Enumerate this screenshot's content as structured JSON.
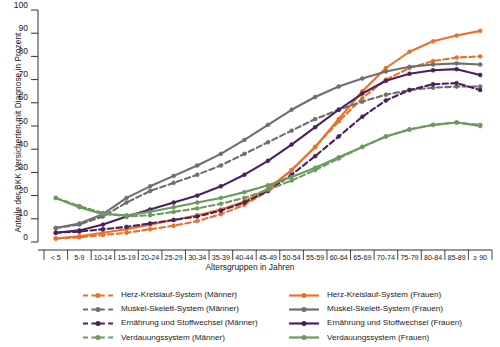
{
  "chart_data": {
    "type": "line",
    "title": "",
    "xlabel": "Altersgruppen in Jahren",
    "ylabel": "Anteile der BKK Versicherten mit Diagnose in Prozent",
    "ylim": [
      0,
      100
    ],
    "ytick_step": 10,
    "grid": false,
    "legend_position": "bottom",
    "yticks": [
      "0",
      "10",
      "20",
      "30",
      "40",
      "50",
      "60",
      "70",
      "80",
      "90",
      "100"
    ],
    "categories": [
      "< 5",
      "5-9",
      "10-14",
      "15-19",
      "20-24",
      "25-29",
      "30-34",
      "35-39",
      "40-44",
      "45-49",
      "50-54",
      "55-59",
      "60-64",
      "65-69",
      "70-74",
      "75-79",
      "80-84",
      "85-89",
      "≥ 90"
    ],
    "series": [
      {
        "name": "Herz-Kreislauf-System (Männer)",
        "color": "#E8722A",
        "style": "dashed",
        "values": [
          1.5,
          2.0,
          3.0,
          4.0,
          5.5,
          7.0,
          9.0,
          12.0,
          16.0,
          22.0,
          31.0,
          41.0,
          52.0,
          62.0,
          70.0,
          75.0,
          78.0,
          79.5,
          80.0
        ]
      },
      {
        "name": "Herz-Kreislauf-System (Frauen)",
        "color": "#E8722A",
        "style": "solid",
        "values": [
          1.5,
          2.5,
          4.0,
          5.5,
          7.5,
          9.5,
          11.5,
          14.0,
          17.5,
          23.0,
          31.0,
          41.0,
          53.0,
          65.0,
          75.0,
          82.0,
          86.5,
          89.0,
          91.0
        ]
      },
      {
        "name": "Muskel-Skelett-System (Männer)",
        "color": "#6E6E6E",
        "style": "dashed",
        "values": [
          6.0,
          7.5,
          11.0,
          17.0,
          22.0,
          25.5,
          29.0,
          33.0,
          38.0,
          43.0,
          48.0,
          53.0,
          57.0,
          60.5,
          63.5,
          65.5,
          66.5,
          67.0,
          67.0
        ]
      },
      {
        "name": "Muskel-Skelett-System (Frauen)",
        "color": "#6E6E6E",
        "style": "solid",
        "values": [
          6.0,
          8.0,
          12.0,
          19.0,
          24.0,
          28.5,
          33.0,
          38.0,
          44.0,
          50.5,
          57.0,
          62.5,
          67.0,
          70.5,
          73.5,
          75.5,
          76.5,
          77.0,
          76.5
        ]
      },
      {
        "name": "Ernährung und Stoffwechsel (Männer)",
        "color": "#4A2060",
        "style": "dashed",
        "values": [
          4.0,
          4.5,
          5.5,
          6.5,
          8.0,
          9.5,
          11.0,
          13.5,
          17.0,
          22.0,
          29.0,
          37.0,
          45.5,
          54.0,
          61.0,
          65.5,
          68.0,
          68.5,
          65.5
        ]
      },
      {
        "name": "Ernährung und Stoffwechsel (Frauen)",
        "color": "#4A2060",
        "style": "solid",
        "values": [
          4.0,
          5.0,
          7.5,
          11.0,
          14.0,
          17.0,
          20.0,
          24.0,
          29.0,
          35.0,
          42.0,
          49.5,
          57.0,
          64.0,
          69.5,
          72.5,
          74.0,
          74.5,
          72.0
        ]
      },
      {
        "name": "Verdauungssystem (Männer)",
        "color": "#6B9B5E",
        "style": "dashed",
        "values": [
          19.0,
          15.5,
          12.5,
          11.0,
          11.5,
          13.0,
          14.5,
          16.5,
          19.0,
          22.5,
          26.5,
          31.0,
          36.0,
          41.0,
          45.5,
          48.5,
          50.5,
          51.5,
          50.5
        ]
      },
      {
        "name": "Verdauungssystem (Frauen)",
        "color": "#6B9B5E",
        "style": "solid",
        "values": [
          19.0,
          15.0,
          12.0,
          11.5,
          13.0,
          15.0,
          17.0,
          19.0,
          21.5,
          24.5,
          28.0,
          32.0,
          36.5,
          41.0,
          45.5,
          48.5,
          50.5,
          51.5,
          50.0
        ]
      }
    ]
  },
  "legend": {
    "columns": [
      {
        "items": [
          {
            "label": "Herz-Kreislauf-System (Männer)",
            "color": "#E8722A",
            "style": "dashed"
          },
          {
            "label": "Muskel-Skelett-System (Männer)",
            "color": "#6E6E6E",
            "style": "dashed"
          },
          {
            "label": "Ernährung und Stoffwechsel (Männer)",
            "color": "#4A2060",
            "style": "dashed"
          },
          {
            "label": "Verdauungssystem (Männer)",
            "color": "#6B9B5E",
            "style": "dashed"
          }
        ]
      },
      {
        "items": [
          {
            "label": "Herz-Kreislauf-System (Frauen)",
            "color": "#E8722A",
            "style": "solid"
          },
          {
            "label": "Muskel-Skelett-System (Frauen)",
            "color": "#6E6E6E",
            "style": "solid"
          },
          {
            "label": "Ernährung und Stoffwechsel (Frauen)",
            "color": "#4A2060",
            "style": "solid"
          },
          {
            "label": "Verdauungssystem (Frauen)",
            "color": "#6B9B5E",
            "style": "solid"
          }
        ]
      }
    ]
  },
  "colors": {
    "herz_kreislauf": "#E8722A",
    "muskel_skelett": "#6E6E6E",
    "ernaehrung": "#4A2060",
    "verdauung": "#6B9B5E",
    "axis": "#1a1a1a",
    "background": "#ffffff"
  }
}
